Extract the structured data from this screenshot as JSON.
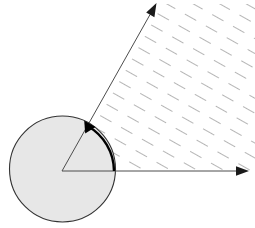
{
  "figure": {
    "canvas": {
      "width": 255,
      "height": 228,
      "background": "#ffffff"
    },
    "vertex": {
      "x": 62,
      "y": 171
    },
    "circle": {
      "name": "shaded-circle",
      "cx": 62.5,
      "cy": 169,
      "r": 53,
      "fill": "#e7e7e7",
      "stroke": "#333333",
      "stroke_width": 1.1
    },
    "rays": [
      {
        "name": "horizontal-ray",
        "x1": 62,
        "y1": 171,
        "x2": 248,
        "y2": 171,
        "stroke": "#4d4d4d",
        "stroke_width": 1,
        "arrowhead": "filled-triangle"
      },
      {
        "name": "diagonal-ray",
        "x1": 62,
        "y1": 171,
        "x2": 156,
        "y2": 4,
        "stroke": "#4d4d4d",
        "stroke_width": 1,
        "arrowhead": "filled-triangle"
      }
    ],
    "angle_arc": {
      "name": "angle-arc",
      "radius": 52,
      "start_deg": 0,
      "end_deg": 60.6,
      "stroke": "#000000",
      "stroke_width": 2.4,
      "arrowhead": "filled-triangle",
      "direction": "counterclockwise"
    },
    "hatch_region": {
      "name": "hatched-sector",
      "pattern": "dashed-parallel-lines",
      "angle_deg": 60.6,
      "stroke": "#5a5a5a",
      "stroke_width": 0.9,
      "dash": "13 11",
      "spacing": 13,
      "note": "dashes run parallel to the diagonal ray, filling the sector between the two rays outside the circle"
    },
    "measured_angle_deg": 60.6
  }
}
